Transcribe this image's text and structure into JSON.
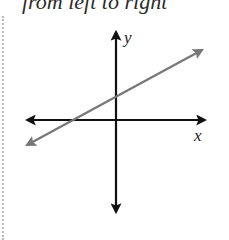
{
  "caption": "from left to right",
  "graph": {
    "x_axis_label": "x",
    "y_axis_label": "y",
    "colors": {
      "axes": "#111111",
      "line": "#777777"
    },
    "line": {
      "description": "line with positive slope, positive y-intercept, arrows on both ends",
      "start": [
        26,
        145
      ],
      "end": [
        203,
        49
      ]
    }
  }
}
